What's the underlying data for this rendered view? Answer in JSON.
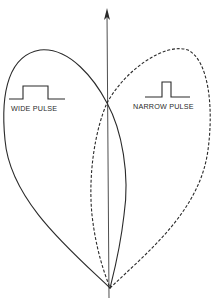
{
  "diagram": {
    "type": "radiation-pattern-comparison",
    "axis": {
      "direction": "up",
      "has_arrow": true
    },
    "lobes": [
      {
        "id": "wide",
        "label": "WIDE PULSE",
        "line_style": "solid",
        "side": "left",
        "pulse_shape": "wide-rectangular-pulse"
      },
      {
        "id": "narrow",
        "label": "NARROW PULSE",
        "line_style": "dashed",
        "side": "right",
        "pulse_shape": "narrow-rectangular-pulse"
      }
    ],
    "colors": {
      "line": "#2a2a2a",
      "background": "#ffffff"
    }
  }
}
